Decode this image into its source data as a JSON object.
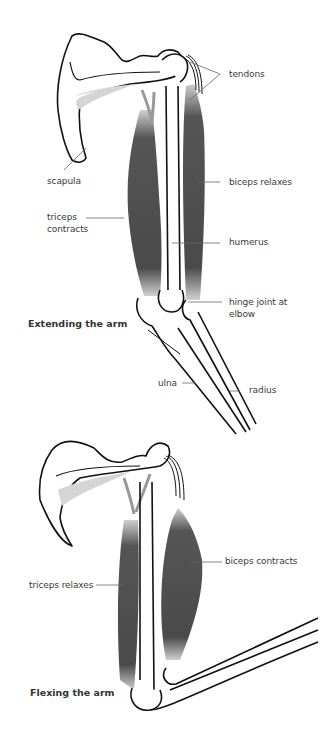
{
  "diagrams": [
    {
      "caption": "Extending the arm",
      "labels": {
        "tendons": "tendons",
        "scapula": "scapula",
        "biceps": "biceps relaxes",
        "triceps_line1": "triceps",
        "triceps_line2": "contracts",
        "humerus": "humerus",
        "hinge_line1": "hinge joint at",
        "hinge_line2": "elbow",
        "ulna": "ulna",
        "radius": "radius"
      }
    },
    {
      "caption": "Flexing the arm",
      "labels": {
        "biceps": "biceps contracts",
        "triceps": "triceps relaxes"
      }
    }
  ],
  "colors": {
    "outline": "#111111",
    "muscle_dark": "#4a4a4a",
    "muscle_light": "#bdbdbd",
    "leader_line": "#666666",
    "background": "#ffffff"
  }
}
